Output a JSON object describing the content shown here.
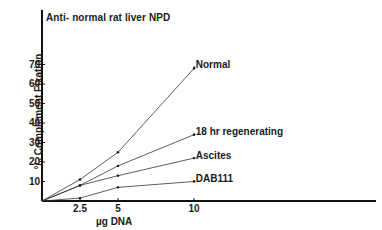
{
  "chart_data": {
    "type": "line",
    "title": "Anti- normal rat liver NPD",
    "xlabel": "µg DNA",
    "ylabel": "% Complement Fixation",
    "xlim": [
      0,
      20
    ],
    "ylim": [
      0,
      80
    ],
    "x_ticks": [
      "2.5",
      "5",
      "10"
    ],
    "y_ticks": [
      "10",
      "20",
      "30",
      "40",
      "50",
      "60",
      "70"
    ],
    "grid": false,
    "legend_position": "inline-right-of-lines",
    "series": [
      {
        "name": "Normal",
        "x": [
          0,
          2.5,
          5,
          10
        ],
        "values": [
          0,
          11,
          25,
          68
        ]
      },
      {
        "name": "18 hr regenerating",
        "x": [
          0,
          2.5,
          5,
          10
        ],
        "values": [
          0,
          8,
          18,
          34
        ]
      },
      {
        "name": "Ascites",
        "x": [
          0,
          2.5,
          5,
          10
        ],
        "values": [
          0,
          8,
          13,
          22
        ]
      },
      {
        "name": "DAB111",
        "x": [
          0,
          2.5,
          5,
          10
        ],
        "values": [
          0,
          1.5,
          7,
          10
        ]
      }
    ]
  },
  "labels": {
    "title": "Anti- normal rat liver NPD",
    "ylabel": "°/₀ Complement Fixation",
    "xlabel": "µg DNA",
    "y_ticks": [
      "70",
      "60",
      "50",
      "40",
      "30",
      "20",
      "10"
    ],
    "x_ticks": [
      "2.5",
      "5",
      "10"
    ],
    "series": [
      ".Normal",
      ".18 hr regenerating",
      ".Ascites",
      ".DAB111"
    ]
  }
}
